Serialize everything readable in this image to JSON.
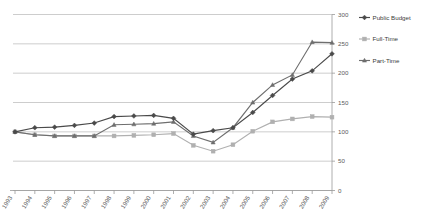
{
  "chart_data": {
    "type": "line",
    "title": "",
    "subtitle": "",
    "xlabel": "",
    "ylabel": "",
    "ylim": [
      0,
      300
    ],
    "yticks": [
      0,
      50,
      100,
      150,
      200,
      250,
      300
    ],
    "ytick_labels": [
      "0",
      "50",
      "100",
      "150",
      "200",
      "250",
      "300"
    ],
    "y_axis_position": "right",
    "grid": true,
    "grid_axis": "y",
    "legend_position": "right",
    "categories": [
      "1993",
      "1994",
      "1995",
      "1996",
      "1997",
      "1998",
      "1999",
      "2000",
      "2001",
      "2002",
      "2003",
      "2004",
      "2005",
      "2006",
      "2007",
      "2008",
      "2009"
    ],
    "series": [
      {
        "name": "Public Budget",
        "color": "#4a4a4a",
        "marker": "diamond",
        "values": [
          100,
          107,
          108,
          111,
          115,
          126,
          127,
          128,
          123,
          96,
          102,
          107,
          133,
          162,
          190,
          204,
          233
        ]
      },
      {
        "name": "Full-Time",
        "color": "#b0b0b0",
        "marker": "square",
        "values": [
          100,
          95,
          93,
          93,
          93,
          93,
          94,
          95,
          97,
          77,
          67,
          78,
          101,
          117,
          122,
          126,
          125
        ]
      },
      {
        "name": "Part-Time",
        "color": "#6e6e6e",
        "marker": "triangle",
        "values": [
          100,
          95,
          93,
          93,
          93,
          112,
          113,
          114,
          117,
          93,
          82,
          107,
          150,
          180,
          197,
          253,
          252
        ]
      }
    ]
  },
  "legend": {
    "items": [
      {
        "label": "Public Budget"
      },
      {
        "label": "Full-Time"
      },
      {
        "label": "Part-Time"
      }
    ]
  },
  "colors": {
    "public_budget": "#4a4a4a",
    "full_time": "#b0b0b0",
    "part_time": "#6e6e6e",
    "grid": "#b7b7b7",
    "axis": "#9a9a9a",
    "text": "#5a5a5a",
    "background": "#ffffff"
  }
}
